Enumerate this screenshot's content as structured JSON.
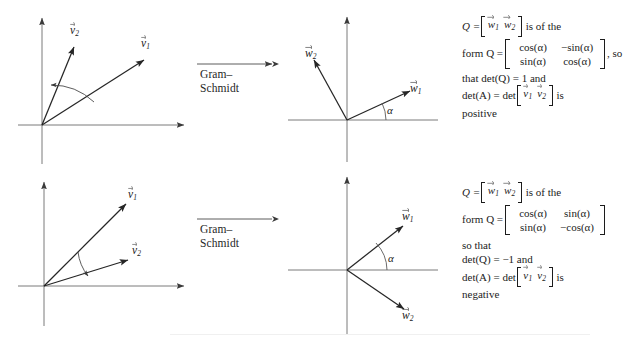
{
  "figure": {
    "transform_label": {
      "line1": "Gram–",
      "line2": "Schmidt"
    },
    "angle_symbol": "α"
  },
  "rows": [
    {
      "id": "top",
      "before": {
        "vectors": [
          {
            "name": "v1",
            "label_base": "v",
            "label_sub": "1"
          },
          {
            "name": "v2",
            "label_base": "v",
            "label_sub": "2"
          }
        ]
      },
      "after": {
        "vectors": [
          {
            "name": "w1",
            "label_base": "w",
            "label_sub": "1"
          },
          {
            "name": "w2",
            "label_base": "w",
            "label_sub": "2"
          }
        ],
        "angle_label": "α"
      },
      "note": {
        "line1_prefix": "Q =",
        "line1_bracket": [
          "w1",
          "w2"
        ],
        "line1_suffix": "is of the",
        "line2_prefix": "form Q =",
        "matrix": [
          [
            "cos(α)",
            "−sin(α)"
          ],
          [
            "sin(α)",
            "cos(α)"
          ]
        ],
        "line2_suffix": ", so",
        "line3": "that det(Q) = 1 and",
        "line4_prefix": "det(A) = det",
        "line4_bracket": [
          "v1",
          "v2"
        ],
        "line4_suffix": "is",
        "line5": "positive"
      }
    },
    {
      "id": "bottom",
      "before": {
        "vectors": [
          {
            "name": "v1",
            "label_base": "v",
            "label_sub": "1"
          },
          {
            "name": "v2",
            "label_base": "v",
            "label_sub": "2"
          }
        ]
      },
      "after": {
        "vectors": [
          {
            "name": "w1",
            "label_base": "w",
            "label_sub": "1"
          },
          {
            "name": "w2",
            "label_base": "w",
            "label_sub": "2"
          }
        ],
        "angle_label": "α"
      },
      "note": {
        "line1_prefix": "Q =",
        "line1_bracket": [
          "w1",
          "w2"
        ],
        "line1_suffix": "is of the",
        "line2_prefix": "form Q =",
        "matrix": [
          [
            "cos(α)",
            "sin(α)"
          ],
          [
            "sin(α)",
            "−cos(α)"
          ]
        ],
        "line2_suffix": "",
        "line3a": "so that",
        "line3": "det(Q) = −1 and",
        "line4_prefix": "det(A) = det",
        "line4_bracket": [
          "v1",
          "v2"
        ],
        "line4_suffix": "is",
        "line5": "negative"
      }
    }
  ],
  "symbols": {
    "equals": "=",
    "Q": "Q",
    "A": "A",
    "det": "det",
    "form_word": "form",
    "is_of_the": "is of the",
    "is": "is"
  },
  "colors": {
    "ink": "#1c1c1c",
    "axis": "#5a5a5a",
    "vector": "#2a2a2a",
    "background": "#ffffff"
  }
}
